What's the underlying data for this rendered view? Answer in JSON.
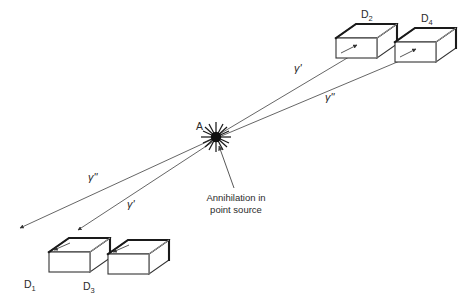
{
  "figure": {
    "background_color": "#ffffff",
    "line_color": "#555555",
    "box_stroke_color": "#333333",
    "box_heavy_edge_color": "#1a1a1a",
    "text_color": "#2b2b2b",
    "width": 466,
    "height": 301
  },
  "source": {
    "point_label": "A",
    "caption_line1": "Annihilation in",
    "caption_line2": "point source",
    "marker_icon": "starburst-icon",
    "pointer_icon": "arrow-up-icon"
  },
  "detectors": [
    {
      "id": "d1",
      "label": "D",
      "subscript": "1",
      "position": "lower-left-inner"
    },
    {
      "id": "d2",
      "label": "D",
      "subscript": "2",
      "position": "upper-right-inner"
    },
    {
      "id": "d3",
      "label": "D",
      "subscript": "3",
      "position": "lower-left-outer"
    },
    {
      "id": "d4",
      "label": "D",
      "subscript": "4",
      "position": "upper-right-outer"
    }
  ],
  "rays": [
    {
      "id": "ray-upper-right-inner",
      "label": "γ'",
      "target": "D2",
      "direction": "up-right"
    },
    {
      "id": "ray-upper-right-outer",
      "label": "γ\"",
      "target": "D4",
      "direction": "up-right"
    },
    {
      "id": "ray-lower-left-upper",
      "label": "γ\"",
      "target": "D1",
      "direction": "down-left"
    },
    {
      "id": "ray-lower-left-lower",
      "label": "γ'",
      "target": "D3",
      "direction": "down-left"
    }
  ]
}
